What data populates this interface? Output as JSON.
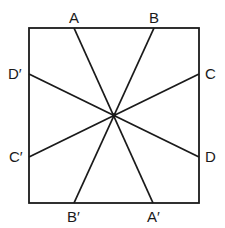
{
  "diagram": {
    "type": "square-with-lines-through-center",
    "square": {
      "x1": 29,
      "y1": 28,
      "x2": 199,
      "y2": 203
    },
    "center": {
      "x": 114,
      "y": 115
    },
    "lines": [
      {
        "name": "AA'",
        "from": {
          "x": 74,
          "y": 28
        },
        "to": {
          "x": 153,
          "y": 203
        }
      },
      {
        "name": "BB'",
        "from": {
          "x": 154,
          "y": 28
        },
        "to": {
          "x": 74,
          "y": 203
        }
      },
      {
        "name": "CC'",
        "from": {
          "x": 199,
          "y": 74
        },
        "to": {
          "x": 29,
          "y": 157
        }
      },
      {
        "name": "DD'",
        "from": {
          "x": 199,
          "y": 157
        },
        "to": {
          "x": 29,
          "y": 74
        }
      }
    ],
    "labels": {
      "A": "A",
      "B": "B",
      "C": "C",
      "D": "D",
      "A_prime": "A′",
      "B_prime": "B′",
      "C_prime": "C′",
      "D_prime": "D′"
    },
    "colors": {
      "stroke": "#1a1a1a",
      "background": "#ffffff"
    }
  }
}
